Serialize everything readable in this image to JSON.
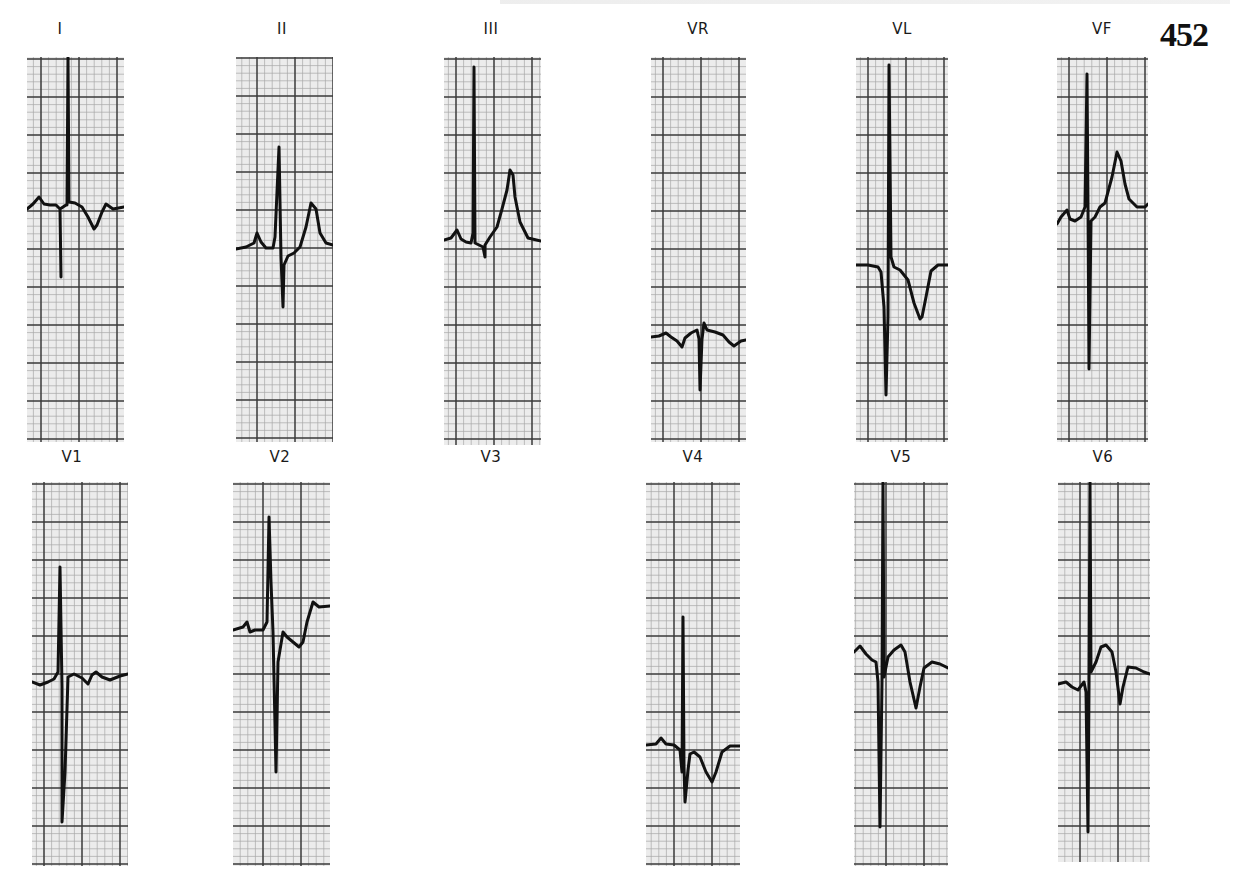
{
  "page": {
    "page_number": "452",
    "header_text": ""
  },
  "style": {
    "paper_bg": "#ececec",
    "grid_minor": "#a8a8a8",
    "grid_major": "#3a3a3a",
    "trace": "#111111"
  },
  "grid": {
    "major_px": 38,
    "minor_div": 5
  },
  "leads": [
    {
      "id": "I",
      "label": "I",
      "label_x": 60,
      "label_y": 20,
      "x": 27,
      "y": 57,
      "w": 97,
      "h": 385,
      "grid_off_x": 14,
      "grid_off_y": 2,
      "trace": [
        [
          0,
          152
        ],
        [
          6,
          147
        ],
        [
          12,
          140
        ],
        [
          17,
          147
        ],
        [
          23,
          148
        ],
        [
          29,
          148
        ],
        [
          33,
          152
        ],
        [
          34,
          220
        ],
        [
          33,
          152
        ],
        [
          39,
          148
        ],
        [
          40,
          148
        ],
        [
          41,
          0
        ],
        [
          42,
          145
        ],
        [
          48,
          146
        ],
        [
          55,
          150
        ],
        [
          61,
          160
        ],
        [
          67,
          172
        ],
        [
          70,
          168
        ],
        [
          75,
          155
        ],
        [
          79,
          147
        ],
        [
          86,
          152
        ],
        [
          97,
          150
        ]
      ],
      "trace_w": 3
    },
    {
      "id": "II",
      "label": "II",
      "label_x": 282,
      "label_y": 20,
      "x": 236,
      "y": 57,
      "w": 97,
      "h": 385,
      "grid_off_x": 21,
      "grid_off_y": 1,
      "trace": [
        [
          0,
          192
        ],
        [
          10,
          190
        ],
        [
          18,
          186
        ],
        [
          21,
          176
        ],
        [
          25,
          185
        ],
        [
          30,
          191
        ],
        [
          37,
          191
        ],
        [
          39,
          180
        ],
        [
          43,
          90
        ],
        [
          45,
          200
        ],
        [
          47,
          250
        ],
        [
          48,
          208
        ],
        [
          52,
          199
        ],
        [
          58,
          196
        ],
        [
          64,
          190
        ],
        [
          70,
          170
        ],
        [
          75,
          146
        ],
        [
          80,
          152
        ],
        [
          84,
          176
        ],
        [
          90,
          186
        ],
        [
          97,
          188
        ]
      ],
      "trace_w": 3
    },
    {
      "id": "III",
      "label": "III",
      "label_x": 491,
      "label_y": 20,
      "x": 444,
      "y": 57,
      "w": 97,
      "h": 388,
      "grid_off_x": 12,
      "grid_off_y": 2,
      "trace": [
        [
          0,
          183
        ],
        [
          7,
          181
        ],
        [
          13,
          173
        ],
        [
          17,
          182
        ],
        [
          22,
          185
        ],
        [
          27,
          186
        ],
        [
          29,
          176
        ],
        [
          30,
          10
        ],
        [
          31,
          186
        ],
        [
          39,
          190
        ],
        [
          41,
          200
        ],
        [
          41,
          188
        ],
        [
          46,
          180
        ],
        [
          53,
          170
        ],
        [
          58,
          152
        ],
        [
          63,
          133
        ],
        [
          66,
          113
        ],
        [
          69,
          118
        ],
        [
          71,
          140
        ],
        [
          76,
          165
        ],
        [
          84,
          181
        ],
        [
          97,
          184
        ]
      ],
      "trace_w": 3
    },
    {
      "id": "VR",
      "label": "VR",
      "label_x": 698,
      "label_y": 20,
      "x": 651,
      "y": 57,
      "w": 95,
      "h": 385,
      "grid_off_x": 12,
      "grid_off_y": 2,
      "trace": [
        [
          0,
          280
        ],
        [
          8,
          279
        ],
        [
          15,
          276
        ],
        [
          20,
          280
        ],
        [
          26,
          284
        ],
        [
          31,
          290
        ],
        [
          34,
          281
        ],
        [
          40,
          276
        ],
        [
          46,
          273
        ],
        [
          48,
          282
        ],
        [
          49,
          333
        ],
        [
          51,
          282
        ],
        [
          53,
          266
        ],
        [
          56,
          273
        ],
        [
          64,
          275
        ],
        [
          72,
          278
        ],
        [
          78,
          285
        ],
        [
          83,
          289
        ],
        [
          90,
          284
        ],
        [
          95,
          283
        ]
      ],
      "trace_w": 3
    },
    {
      "id": "VL",
      "label": "VL",
      "label_x": 902,
      "label_y": 20,
      "x": 856,
      "y": 57,
      "w": 92,
      "h": 385,
      "grid_off_x": 12,
      "grid_off_y": 2,
      "trace": [
        [
          0,
          208
        ],
        [
          12,
          208
        ],
        [
          22,
          210
        ],
        [
          25,
          215
        ],
        [
          28,
          250
        ],
        [
          30,
          338
        ],
        [
          32,
          260
        ],
        [
          33,
          8
        ],
        [
          35,
          200
        ],
        [
          38,
          210
        ],
        [
          44,
          213
        ],
        [
          52,
          223
        ],
        [
          58,
          246
        ],
        [
          64,
          262
        ],
        [
          66,
          260
        ],
        [
          70,
          240
        ],
        [
          75,
          214
        ],
        [
          82,
          208
        ],
        [
          92,
          208
        ]
      ],
      "trace_w": 3
    },
    {
      "id": "VF",
      "label": "VF",
      "label_x": 1102,
      "label_y": 20,
      "x": 1057,
      "y": 57,
      "w": 91,
      "h": 385,
      "grid_off_x": 12,
      "grid_off_y": 2,
      "trace": [
        [
          0,
          167
        ],
        [
          4,
          160
        ],
        [
          10,
          153
        ],
        [
          13,
          162
        ],
        [
          18,
          164
        ],
        [
          24,
          160
        ],
        [
          28,
          150
        ],
        [
          30,
          17
        ],
        [
          31,
          150
        ],
        [
          32,
          312
        ],
        [
          34,
          164
        ],
        [
          38,
          160
        ],
        [
          43,
          150
        ],
        [
          48,
          146
        ],
        [
          55,
          120
        ],
        [
          60,
          95
        ],
        [
          64,
          104
        ],
        [
          68,
          127
        ],
        [
          72,
          142
        ],
        [
          80,
          150
        ],
        [
          88,
          150
        ],
        [
          91,
          147
        ]
      ],
      "trace_w": 3
    },
    {
      "id": "V1",
      "label": "V1",
      "label_x": 72,
      "label_y": 448,
      "x": 32,
      "y": 482,
      "w": 96,
      "h": 384,
      "grid_off_x": 12,
      "grid_off_y": 2,
      "trace": [
        [
          0,
          200
        ],
        [
          8,
          203
        ],
        [
          16,
          200
        ],
        [
          22,
          197
        ],
        [
          26,
          190
        ],
        [
          28,
          85
        ],
        [
          30,
          205
        ],
        [
          30,
          340
        ],
        [
          33,
          290
        ],
        [
          36,
          195
        ],
        [
          42,
          192
        ],
        [
          50,
          196
        ],
        [
          56,
          202
        ],
        [
          60,
          193
        ],
        [
          64,
          190
        ],
        [
          70,
          195
        ],
        [
          78,
          198
        ],
        [
          88,
          194
        ],
        [
          96,
          192
        ]
      ],
      "trace_w": 3
    },
    {
      "id": "V2",
      "label": "V2",
      "label_x": 280,
      "label_y": 448,
      "x": 233,
      "y": 482,
      "w": 97,
      "h": 384,
      "grid_off_x": 30,
      "grid_off_y": 2,
      "trace": [
        [
          0,
          148
        ],
        [
          10,
          145
        ],
        [
          14,
          140
        ],
        [
          17,
          150
        ],
        [
          22,
          148
        ],
        [
          30,
          148
        ],
        [
          34,
          140
        ],
        [
          36,
          35
        ],
        [
          38,
          100
        ],
        [
          40,
          150
        ],
        [
          43,
          290
        ],
        [
          45,
          180
        ],
        [
          50,
          150
        ],
        [
          54,
          155
        ],
        [
          60,
          160
        ],
        [
          66,
          165
        ],
        [
          70,
          160
        ],
        [
          74,
          140
        ],
        [
          80,
          120
        ],
        [
          86,
          125
        ],
        [
          97,
          124
        ]
      ],
      "trace_w": 3
    },
    {
      "id": "V3",
      "label": "V3",
      "label_x": 491,
      "label_y": 448,
      "blank": true
    },
    {
      "id": "V4",
      "label": "V4",
      "label_x": 693,
      "label_y": 448,
      "x": 646,
      "y": 482,
      "w": 94,
      "h": 384,
      "grid_off_x": 28,
      "grid_off_y": 2,
      "trace": [
        [
          0,
          263
        ],
        [
          10,
          262
        ],
        [
          15,
          256
        ],
        [
          20,
          262
        ],
        [
          28,
          263
        ],
        [
          34,
          268
        ],
        [
          36,
          290
        ],
        [
          37,
          135
        ],
        [
          38,
          284
        ],
        [
          39,
          320
        ],
        [
          42,
          288
        ],
        [
          44,
          272
        ],
        [
          48,
          270
        ],
        [
          54,
          275
        ],
        [
          60,
          290
        ],
        [
          66,
          300
        ],
        [
          70,
          290
        ],
        [
          76,
          270
        ],
        [
          84,
          264
        ],
        [
          94,
          264
        ]
      ],
      "trace_w": 3
    },
    {
      "id": "V5",
      "label": "V5",
      "label_x": 901,
      "label_y": 448,
      "x": 854,
      "y": 482,
      "w": 94,
      "h": 384,
      "grid_off_x": 32,
      "grid_off_y": 2,
      "trace": [
        [
          0,
          170
        ],
        [
          6,
          164
        ],
        [
          12,
          172
        ],
        [
          18,
          178
        ],
        [
          22,
          180
        ],
        [
          24,
          200
        ],
        [
          26,
          345
        ],
        [
          28,
          200
        ],
        [
          29,
          0
        ],
        [
          30,
          195
        ],
        [
          34,
          175
        ],
        [
          40,
          168
        ],
        [
          47,
          163
        ],
        [
          51,
          170
        ],
        [
          56,
          200
        ],
        [
          62,
          226
        ],
        [
          66,
          205
        ],
        [
          70,
          186
        ],
        [
          78,
          180
        ],
        [
          86,
          182
        ],
        [
          94,
          186
        ]
      ],
      "trace_w": 3
    },
    {
      "id": "V6",
      "label": "V6",
      "label_x": 1103,
      "label_y": 448,
      "x": 1058,
      "y": 482,
      "w": 92,
      "h": 380,
      "grid_off_x": 22,
      "grid_off_y": 2,
      "trace": [
        [
          0,
          202
        ],
        [
          8,
          200
        ],
        [
          14,
          205
        ],
        [
          20,
          208
        ],
        [
          26,
          200
        ],
        [
          28,
          210
        ],
        [
          30,
          350
        ],
        [
          31,
          205
        ],
        [
          32,
          0
        ],
        [
          33,
          190
        ],
        [
          38,
          180
        ],
        [
          43,
          165
        ],
        [
          48,
          163
        ],
        [
          54,
          170
        ],
        [
          58,
          190
        ],
        [
          62,
          222
        ],
        [
          65,
          205
        ],
        [
          70,
          185
        ],
        [
          78,
          186
        ],
        [
          86,
          190
        ],
        [
          92,
          192
        ]
      ],
      "trace_w": 3
    }
  ]
}
